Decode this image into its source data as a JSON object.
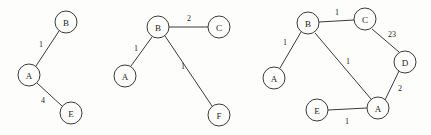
{
  "figure": {
    "title": "",
    "background_color": "#fdfdfb",
    "stroke_color": "#3a3a3a",
    "text_color": "#242424",
    "width": 431,
    "height": 135
  },
  "graphs": [
    {
      "id": "graph-1",
      "nodes": [
        {
          "id": "g1-B",
          "label": "B",
          "cx": 66,
          "cy": 22,
          "r": 11
        },
        {
          "id": "g1-A",
          "label": "A",
          "cx": 29,
          "cy": 75,
          "r": 11
        },
        {
          "id": "g1-E",
          "label": "E",
          "cx": 71,
          "cy": 113,
          "r": 11
        }
      ],
      "edges": [
        {
          "id": "g1-e1",
          "from": "A",
          "to": "B",
          "weight": "1",
          "x1": 36,
          "y1": 66,
          "x2": 59,
          "y2": 31,
          "lx": 41,
          "ly": 44
        },
        {
          "id": "g1-e2",
          "from": "A",
          "to": "E",
          "weight": "4",
          "x1": 37,
          "y1": 83,
          "x2": 62,
          "y2": 106,
          "lx": 43,
          "ly": 100
        }
      ]
    },
    {
      "id": "graph-2",
      "nodes": [
        {
          "id": "g2-B",
          "label": "B",
          "cx": 158,
          "cy": 27,
          "r": 11
        },
        {
          "id": "g2-C",
          "label": "C",
          "cx": 219,
          "cy": 27,
          "r": 11
        },
        {
          "id": "g2-A",
          "label": "A",
          "cx": 125,
          "cy": 76,
          "r": 11
        },
        {
          "id": "g2-F",
          "label": "F",
          "cx": 219,
          "cy": 115,
          "r": 11
        }
      ],
      "edges": [
        {
          "id": "g2-e1",
          "from": "B",
          "to": "C",
          "weight": "2",
          "x1": 169,
          "y1": 27,
          "x2": 208,
          "y2": 27,
          "lx": 189,
          "ly": 18
        },
        {
          "id": "g2-e2",
          "from": "B",
          "to": "A",
          "weight": "1",
          "x1": 152,
          "y1": 37,
          "x2": 131,
          "y2": 66,
          "lx": 136,
          "ly": 48
        },
        {
          "id": "g2-e3",
          "from": "B",
          "to": "F",
          "weight": "1",
          "x1": 165,
          "y1": 36,
          "x2": 212,
          "y2": 106,
          "lx": 183,
          "ly": 66
        }
      ]
    },
    {
      "id": "graph-3",
      "nodes": [
        {
          "id": "g3-B",
          "label": "B",
          "cx": 308,
          "cy": 23,
          "r": 11
        },
        {
          "id": "g3-C",
          "label": "C",
          "cx": 365,
          "cy": 19,
          "r": 11
        },
        {
          "id": "g3-A-left",
          "label": "A",
          "cx": 274,
          "cy": 78,
          "r": 11
        },
        {
          "id": "g3-D",
          "label": "D",
          "cx": 405,
          "cy": 62,
          "r": 11
        },
        {
          "id": "g3-A-bottom",
          "label": "A",
          "cx": 378,
          "cy": 108,
          "r": 11
        },
        {
          "id": "g3-E",
          "label": "E",
          "cx": 317,
          "cy": 110,
          "r": 11
        }
      ],
      "edges": [
        {
          "id": "g3-e1",
          "from": "B",
          "to": "C",
          "weight": "1",
          "x1": 319,
          "y1": 22,
          "x2": 354,
          "y2": 20,
          "lx": 337,
          "ly": 12
        },
        {
          "id": "g3-e2",
          "from": "B",
          "to": "A-left",
          "weight": "1",
          "x1": 301,
          "y1": 32,
          "x2": 280,
          "y2": 68,
          "lx": 285,
          "ly": 42
        },
        {
          "id": "g3-e3",
          "from": "C",
          "to": "D",
          "weight": "23",
          "x1": 372,
          "y1": 29,
          "x2": 399,
          "y2": 52,
          "lx": 392,
          "ly": 34
        },
        {
          "id": "g3-e4",
          "from": "B",
          "to": "A-bottom",
          "weight": "1",
          "x1": 315,
          "y1": 33,
          "x2": 371,
          "y2": 99,
          "lx": 348,
          "ly": 61
        },
        {
          "id": "g3-e5",
          "from": "D",
          "to": "A-bottom",
          "weight": "2",
          "x1": 399,
          "y1": 71,
          "x2": 385,
          "y2": 100,
          "lx": 400,
          "ly": 88
        },
        {
          "id": "g3-e6",
          "from": "E",
          "to": "A-bottom",
          "weight": "1",
          "x1": 328,
          "y1": 110,
          "x2": 367,
          "y2": 108,
          "lx": 347,
          "ly": 121
        }
      ]
    }
  ]
}
